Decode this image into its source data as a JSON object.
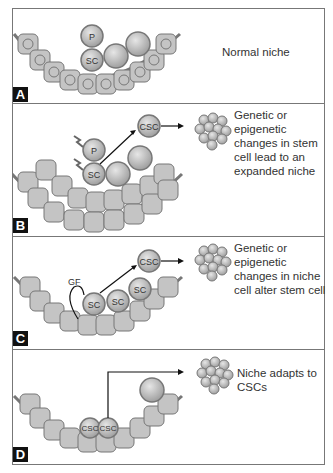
{
  "panels": [
    {
      "letter": "A",
      "caption": "Normal niche",
      "labels": {
        "progenitor": "P",
        "stem_cell": "SC"
      }
    },
    {
      "letter": "B",
      "caption": "Genetic or epigenetic changes in stem cell lead to an expanded niche",
      "labels": {
        "progenitor": "P",
        "stem_cell": "SC",
        "cancer_stem_cell": "CSC"
      }
    },
    {
      "letter": "C",
      "caption": "Genetic or epigenetic changes in niche cell alter stem cell",
      "labels": {
        "growth_factor": "GF",
        "stem_cell": "SC",
        "cancer_stem_cell": "CSC"
      }
    },
    {
      "letter": "D",
      "caption": "Niche adapts to CSCs",
      "labels": {
        "cancer_stem_cell": "CSC"
      }
    }
  ],
  "colors": {
    "cell_fill": "#c8c8c8",
    "cell_stroke": "#6e6e6e",
    "niche_fill": "#bdbdbd",
    "label_bg": "#111111",
    "text": "#333333"
  }
}
